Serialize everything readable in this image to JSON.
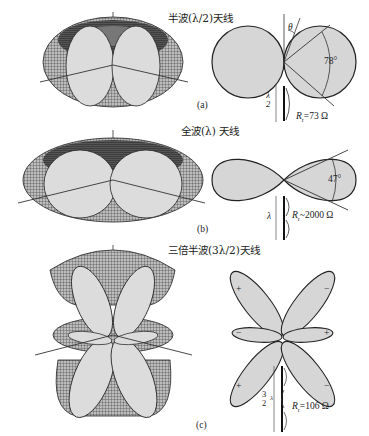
{
  "panels": [
    {
      "id": "a",
      "title": "半波(λ/2)天线",
      "caption": "(a)",
      "angle_symbol": "θ",
      "beamwidth": "78°",
      "length_label": "λ/2",
      "length_num": "λ",
      "length_den": "2",
      "resistance_label": "R",
      "resistance_sub": "r",
      "resistance_value": "=73 Ω"
    },
    {
      "id": "b",
      "title": "全波(λ) 天线",
      "caption": "(b)",
      "beamwidth": "47°",
      "length_label": "λ",
      "resistance_label": "R",
      "resistance_sub": "r",
      "resistance_value": "~2000 Ω"
    },
    {
      "id": "c",
      "title": "三倍半波(3λ/2)天线",
      "caption": "(c)",
      "length_num": "3",
      "length_den": "2",
      "length_unit": "λ",
      "resistance_label": "R",
      "resistance_sub": "r",
      "resistance_value": "=106 Ω",
      "lobe_signs": [
        "+",
        "−",
        "−",
        "+",
        "+",
        "−"
      ]
    }
  ]
}
